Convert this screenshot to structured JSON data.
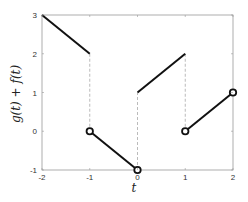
{
  "chart_data": {
    "type": "line",
    "title": "",
    "xlabel": "t",
    "ylabel": "g(t) + f(t)",
    "xlim": [
      -2,
      2
    ],
    "ylim": [
      -1,
      3
    ],
    "xticks": [
      -2,
      -1,
      0,
      1,
      2
    ],
    "yticks": [
      -1,
      0,
      1,
      2,
      3
    ],
    "xtick_labels": [
      "-2",
      "-1",
      "0",
      "1",
      "2"
    ],
    "ytick_labels": [
      "-1",
      "0",
      "1",
      "2",
      "3"
    ],
    "grid": false,
    "legend": null,
    "segments": [
      {
        "x": [
          -2,
          -1
        ],
        "y": [
          3,
          2
        ],
        "style": "solid"
      },
      {
        "x": [
          -1,
          0
        ],
        "y": [
          0,
          -1
        ],
        "style": "solid"
      },
      {
        "x": [
          0,
          1
        ],
        "y": [
          1,
          2
        ],
        "style": "solid"
      },
      {
        "x": [
          1,
          2
        ],
        "y": [
          0,
          1
        ],
        "style": "solid"
      }
    ],
    "jump_lines": [
      {
        "x": -1,
        "y": [
          2,
          0
        ],
        "style": "dashed"
      },
      {
        "x": 0,
        "y": [
          -1,
          1
        ],
        "style": "dashed"
      },
      {
        "x": 1,
        "y": [
          2,
          0
        ],
        "style": "dashed"
      }
    ],
    "open_circles": [
      {
        "x": -1,
        "y": 0
      },
      {
        "x": 0,
        "y": -1
      },
      {
        "x": 1,
        "y": 0
      },
      {
        "x": 2,
        "y": 1
      }
    ],
    "colors": {
      "line": "#111111",
      "dashed": "#aaaaaa",
      "axes": "#999999"
    }
  }
}
